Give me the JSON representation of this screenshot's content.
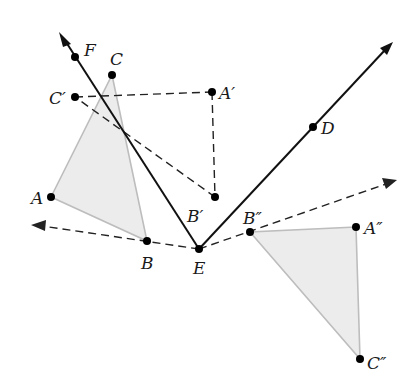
{
  "diagram": {
    "title": "",
    "colors": {
      "triangle_fill": "#ececec",
      "triangle_stroke": "#bdbdbd",
      "line": "#111111",
      "point": "#000000"
    },
    "points": {
      "A": {
        "label": "A",
        "x": 51,
        "y": 197
      },
      "B": {
        "label": "B",
        "x": 147,
        "y": 241
      },
      "C": {
        "label": "C",
        "x": 112,
        "y": 75
      },
      "A1": {
        "label": "A′",
        "x": 212,
        "y": 92
      },
      "B1": {
        "label": "B′",
        "x": 215,
        "y": 197
      },
      "C1": {
        "label": "C′",
        "x": 75,
        "y": 97
      },
      "A2": {
        "label": "A″",
        "x": 356,
        "y": 227
      },
      "B2": {
        "label": "B″",
        "x": 250,
        "y": 232
      },
      "C2": {
        "label": "C″",
        "x": 360,
        "y": 359
      },
      "D": {
        "label": "D",
        "x": 313,
        "y": 127
      },
      "E": {
        "label": "E",
        "x": 199,
        "y": 249
      },
      "F": {
        "label": "F",
        "x": 75,
        "y": 57
      }
    },
    "shapes": {
      "triangle_ABC": "Triangle ABC (shaded)",
      "triangle_A2B2C2": "Triangle A″B″C″ (shaded)",
      "triangle_A1B1C1": "Triangle A′B′C′ (dashed outline)"
    },
    "rays": {
      "EF": "Ray EF (solid, arrow)",
      "ED": "Ray ED (solid, arrow)",
      "EB": "Ray EB (dashed, arrow)",
      "EB2": "Ray EB″ (dashed, arrow)"
    }
  }
}
